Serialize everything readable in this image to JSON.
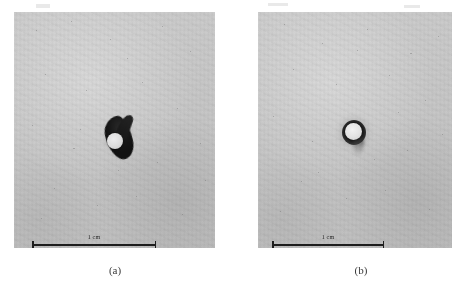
{
  "figure": {
    "kind": "two-panel-micrograph",
    "background_color": "#ffffff",
    "panel_tone_color": "#c9c9c9",
    "feature_color": "#181818",
    "hole_color": "#e8e8e8",
    "scalebar_color": "#1d1d1d",
    "caption_color": "#3a3a3a"
  },
  "panels": [
    {
      "id": "a",
      "caption": "(a)",
      "scalebar": {
        "label": "1 cm",
        "length_value": "1",
        "length_unit": "cm"
      },
      "feature": {
        "name": "perforation-with-dark-deposit",
        "shape": "irregular comma-shaped dark blob with bright circular hole"
      }
    },
    {
      "id": "b",
      "caption": "(b)",
      "scalebar": {
        "label": "1 cm",
        "length_value": "1",
        "length_unit": "cm"
      },
      "feature": {
        "name": "perforation-with-dark-ring",
        "shape": "near-circular dark ring with bright circular hole"
      }
    }
  ]
}
